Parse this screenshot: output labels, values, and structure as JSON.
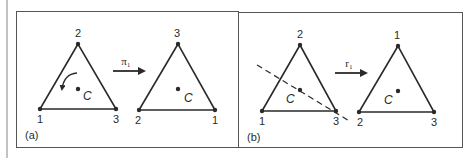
{
  "figure": {
    "panels": [
      {
        "id": "a",
        "tag": "(a)",
        "operation": {
          "label": "π₁",
          "name": "rotation"
        },
        "before": {
          "top": "2",
          "bottom_left": "1",
          "bottom_right": "3",
          "center": "C"
        },
        "after": {
          "top": "3",
          "bottom_left": "2",
          "bottom_right": "1",
          "center": "C"
        },
        "annotation": "curved rotation arrow (counterclockwise) inside triangle"
      },
      {
        "id": "b",
        "tag": "(b)",
        "operation": {
          "label": "r₁",
          "name": "reflection"
        },
        "before": {
          "top": "2",
          "bottom_left": "1",
          "bottom_right": "3",
          "center": "C"
        },
        "after": {
          "top": "1",
          "bottom_left": "2",
          "bottom_right": "3",
          "center": "C"
        },
        "annotation": "dashed reflection axis through vertex 3 and center C"
      }
    ]
  },
  "colors": {
    "ink": "#2a2a2a",
    "frame": "#555555",
    "background": "#ffffff"
  }
}
